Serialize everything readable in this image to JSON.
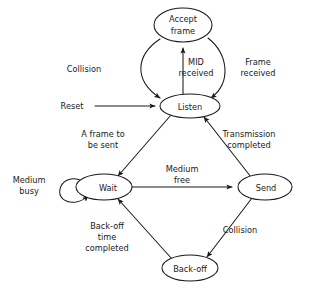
{
  "diagram": {
    "type": "state-transition-diagram",
    "background_color": "#ffffff",
    "stroke_color": "#1a1a1a",
    "text_color": "#1a1a1a",
    "nodes": [
      {
        "id": "accept-frame",
        "label_lines": [
          "Accept",
          "frame"
        ],
        "label": "Accept frame",
        "cx": 183,
        "cy": 25,
        "rx": 29,
        "ry": 17
      },
      {
        "id": "listen",
        "label_lines": [
          "Listen"
        ],
        "label": "Listen",
        "cx": 190,
        "cy": 106,
        "rx": 30,
        "ry": 12
      },
      {
        "id": "wait",
        "label_lines": [
          "Wait"
        ],
        "label": "Wait",
        "cx": 104,
        "cy": 187,
        "rx": 28,
        "ry": 13
      },
      {
        "id": "send",
        "label_lines": [
          "Send"
        ],
        "label": "Send",
        "cx": 265,
        "cy": 187,
        "rx": 27,
        "ry": 13
      },
      {
        "id": "back-off",
        "label_lines": [
          "Back-off"
        ],
        "label": "Back-off",
        "cx": 190,
        "cy": 268,
        "rx": 28,
        "ry": 13
      }
    ],
    "edges": [
      {
        "id": "reset-to-listen",
        "from": "start",
        "to": "listen",
        "label": "Reset",
        "label_lines": [
          "Reset"
        ]
      },
      {
        "id": "listen-to-accept-frame",
        "from": "listen",
        "to": "accept-frame",
        "label": "MID received",
        "label_lines": [
          "MID",
          "received"
        ]
      },
      {
        "id": "accept-frame-to-listen-right",
        "from": "accept-frame",
        "to": "listen",
        "label": "Frame received",
        "label_lines": [
          "Frame",
          "received"
        ]
      },
      {
        "id": "accept-frame-to-listen-left",
        "from": "accept-frame",
        "to": "listen",
        "label": "Collision",
        "label_lines": [
          "Collision"
        ]
      },
      {
        "id": "listen-to-wait",
        "from": "listen",
        "to": "wait",
        "label": "A frame to be sent",
        "label_lines": [
          "A frame to",
          "be sent"
        ]
      },
      {
        "id": "send-to-listen",
        "from": "send",
        "to": "listen",
        "label": "Transmission completed",
        "label_lines": [
          "Transmission",
          "completed"
        ]
      },
      {
        "id": "wait-self-loop",
        "from": "wait",
        "to": "wait",
        "label": "Medium busy",
        "label_lines": [
          "Medium",
          "busy"
        ]
      },
      {
        "id": "wait-to-send",
        "from": "wait",
        "to": "send",
        "label": "Medium free",
        "label_lines": [
          "Medium",
          "free"
        ]
      },
      {
        "id": "send-to-back-off",
        "from": "send",
        "to": "back-off",
        "label": "Collision",
        "label_lines": [
          "Collision"
        ]
      },
      {
        "id": "back-off-to-wait",
        "from": "back-off",
        "to": "wait",
        "label": "Back-off time completed",
        "label_lines": [
          "Back-off",
          "time",
          "completed"
        ]
      }
    ],
    "labels": {
      "accept_frame_l1": "Accept",
      "accept_frame_l2": "frame",
      "listen": "Listen",
      "wait": "Wait",
      "send": "Send",
      "back_off": "Back-off",
      "reset": "Reset",
      "collision_top": "Collision",
      "mid_l1": "MID",
      "mid_l2": "received",
      "frame_recv_l1": "Frame",
      "frame_recv_l2": "received",
      "a_frame_l1": "A frame to",
      "a_frame_l2": "be sent",
      "transmission_l1": "Transmission",
      "transmission_l2": "completed",
      "medium_busy_l1": "Medium",
      "medium_busy_l2": "busy",
      "medium_free_l1": "Medium",
      "medium_free_l2": "free",
      "collision_bottom": "Collision",
      "backoff_time_l1": "Back-off",
      "backoff_time_l2": "time",
      "backoff_time_l3": "completed"
    }
  }
}
